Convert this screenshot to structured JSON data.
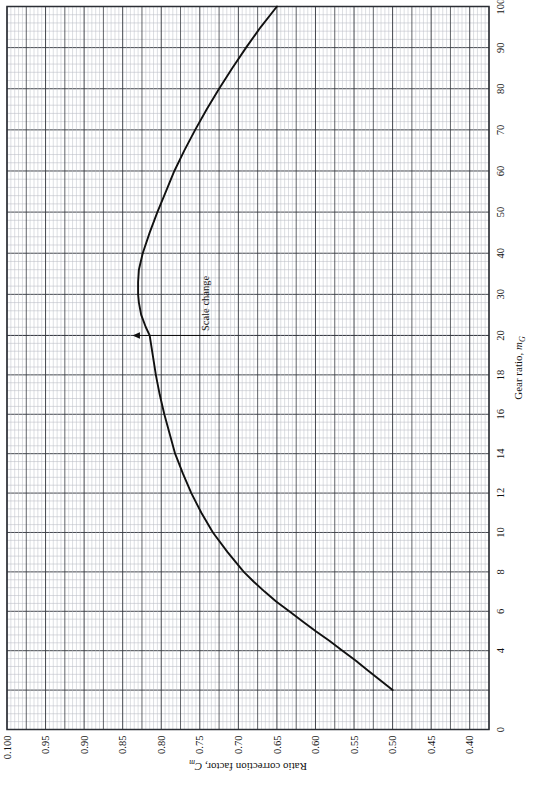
{
  "chart_data": {
    "type": "line",
    "title": "",
    "xlabel": "Gear ratio, mG",
    "xlabel_main": "Gear ratio, ",
    "xlabel_sym": "m",
    "xlabel_sub": "G",
    "ylabel": "Ratio correction factor, Cm",
    "ylabel_main": "Ratio correction factor, ",
    "ylabel_sym": "C",
    "ylabel_sub": "m",
    "grid": true,
    "legend": "none",
    "xlim": [
      0,
      100
    ],
    "ylim": [
      0.375,
      1.0
    ],
    "x_scale_break_at": 20,
    "x_ticks_labeled": [
      "0",
      "4",
      "6",
      "8",
      "10",
      "12",
      "14",
      "16",
      "18",
      "20",
      "30",
      "40",
      "50",
      "60",
      "70",
      "80",
      "90",
      "100"
    ],
    "x_tick_values": [
      0,
      4,
      6,
      8,
      10,
      12,
      14,
      16,
      18,
      20,
      30,
      40,
      50,
      60,
      70,
      80,
      90,
      100
    ],
    "y_ticks_labeled": [
      "0.100",
      "0.95",
      "0.90",
      "0.85",
      "0.80",
      "0.75",
      "0.70",
      "0.65",
      "0.60",
      "0.55",
      "0.50",
      "0.45",
      "0.40"
    ],
    "y_tick_values": [
      1.0,
      0.95,
      0.9,
      0.85,
      0.8,
      0.75,
      0.7,
      0.65,
      0.6,
      0.55,
      0.5,
      0.45,
      0.4
    ],
    "annotations": [
      {
        "text": "Scale change",
        "x": 20,
        "y": 0.78,
        "arrow": "up-to-scale-break"
      }
    ],
    "series": [
      {
        "name": "Ratio correction factor",
        "x": [
          2.0,
          2.5,
          3.0,
          3.5,
          4.0,
          4.5,
          5.0,
          5.5,
          6.0,
          6.5,
          7.0,
          7.5,
          8.0,
          9.0,
          10.0,
          11.0,
          12.0,
          13.0,
          14.0,
          15.0,
          16.0,
          17.0,
          18.0,
          19.0,
          20.0,
          22.0,
          25.0,
          28.0,
          30.0,
          33.0,
          36.0,
          40.0,
          45.0,
          50.0,
          55.0,
          60.0,
          65.0,
          70.0,
          75.0,
          80.0,
          85.0,
          90.0,
          95.0,
          100.0
        ],
        "y": [
          0.5,
          0.516,
          0.532,
          0.548,
          0.565,
          0.582,
          0.6,
          0.617,
          0.634,
          0.651,
          0.666,
          0.68,
          0.693,
          0.714,
          0.733,
          0.748,
          0.761,
          0.772,
          0.782,
          0.789,
          0.796,
          0.802,
          0.807,
          0.811,
          0.815,
          0.82,
          0.826,
          0.829,
          0.83,
          0.83,
          0.829,
          0.824,
          0.815,
          0.805,
          0.794,
          0.783,
          0.77,
          0.756,
          0.741,
          0.725,
          0.708,
          0.69,
          0.671,
          0.65
        ]
      }
    ]
  }
}
